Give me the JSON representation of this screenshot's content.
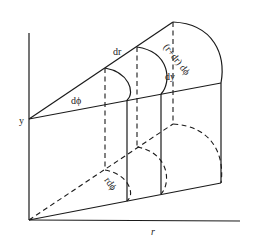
{
  "diagram": {
    "labels": {
      "y_axis": "y",
      "r_axis": "r",
      "dr": "dr",
      "dphi": "dϕ",
      "arc_outer": "(r+dr) dϕ",
      "arc_inner": "rdϕ",
      "dy": "dy"
    },
    "line_color": "#1a1a1a",
    "background": "#ffffff"
  }
}
